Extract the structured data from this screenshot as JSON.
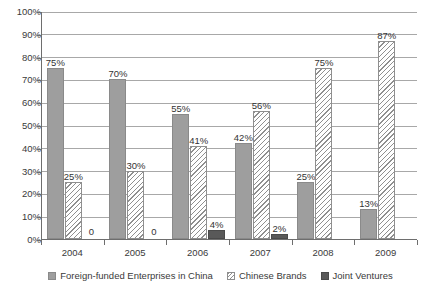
{
  "chart_data": {
    "type": "bar",
    "title": "",
    "subtitle": "",
    "xlabel": "",
    "ylabel": "",
    "categories": [
      "2004",
      "2005",
      "2006",
      "2007",
      "2008",
      "2009"
    ],
    "series": [
      {
        "name": "Foreign-funded Enterprises in China",
        "color": "#9e9e9e",
        "fill": "solid",
        "values": [
          75,
          70,
          55,
          42,
          25,
          13
        ],
        "labels": [
          "75%",
          "70%",
          "55%",
          "42%",
          "25%",
          "13%"
        ]
      },
      {
        "name": "Chinese Brands",
        "color": "#8f8f8f",
        "fill": "diagonal-hatch",
        "values": [
          25,
          30,
          41,
          56,
          75,
          87
        ],
        "labels": [
          "25%",
          "30%",
          "41%",
          "56%",
          "75%",
          "87%"
        ]
      },
      {
        "name": "Joint Ventures",
        "color": "#595959",
        "fill": "solid",
        "values": [
          0,
          0,
          4,
          2,
          0,
          0
        ],
        "labels": [
          "0",
          "0",
          "4%",
          "2%",
          "",
          ""
        ]
      }
    ],
    "ylim": [
      0,
      100
    ],
    "yticks": [
      0,
      10,
      20,
      30,
      40,
      50,
      60,
      70,
      80,
      90,
      100
    ],
    "ytick_labels": [
      "0%",
      "10%",
      "20%",
      "30%",
      "40%",
      "50%",
      "60%",
      "70%",
      "80%",
      "90%",
      "100%"
    ],
    "grid": "horizontal",
    "legend_position": "bottom"
  }
}
